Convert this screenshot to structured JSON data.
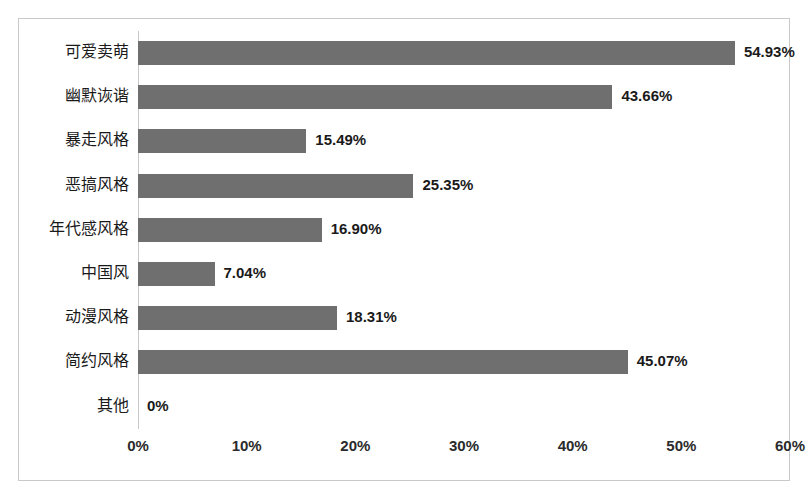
{
  "chart_data": {
    "type": "bar",
    "orientation": "horizontal",
    "title": "",
    "subtitle": "",
    "xlabel": "",
    "ylabel": "",
    "grid": false,
    "legend": false,
    "xlim": [
      0,
      60
    ],
    "xticks": [
      "0%",
      "10%",
      "20%",
      "30%",
      "40%",
      "50%",
      "60%"
    ],
    "xtick_values": [
      0,
      10,
      20,
      30,
      40,
      50,
      60
    ],
    "categories": [
      "可爱卖萌",
      "幽默诙谐",
      "暴走风格",
      "恶搞风格",
      "年代感风格",
      "中国风",
      "动漫风格",
      "简约风格",
      "其他"
    ],
    "values": [
      54.93,
      43.66,
      15.49,
      25.35,
      16.9,
      7.04,
      18.31,
      45.07,
      0
    ],
    "value_labels": [
      "54.93%",
      "43.66%",
      "15.49%",
      "25.35%",
      "16.90%",
      "7.04%",
      "18.31%",
      "45.07%",
      "0%"
    ],
    "bar_color": "#6f6f6f",
    "frame_color": "#c9c9c9",
    "background": "#ffffff",
    "text_color": "#1a1a1a"
  }
}
